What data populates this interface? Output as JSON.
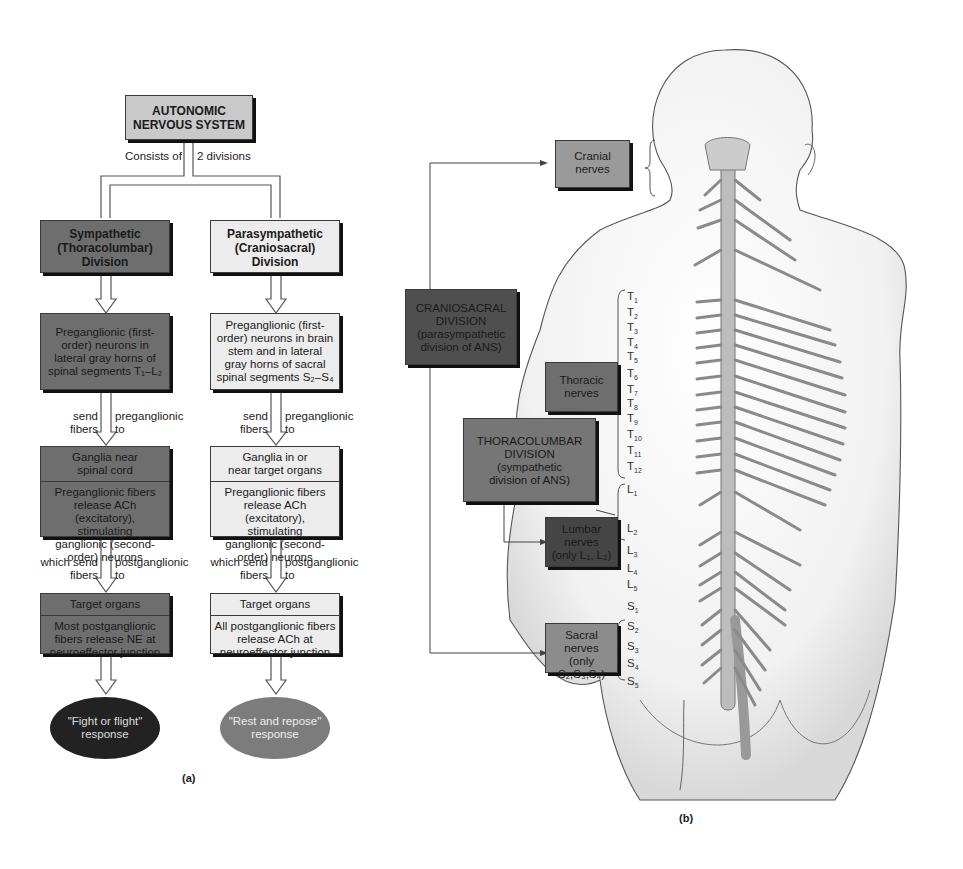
{
  "panel_a": {
    "caption": "(a)",
    "title": [
      "AUTONOMIC",
      "NERVOUS SYSTEM"
    ],
    "split_label_left": "Consists of",
    "split_label_right": "2 divisions",
    "sympathetic": {
      "division": [
        "Sympathetic",
        "(Thoracolumbar)",
        "Division"
      ],
      "preganglionic": [
        "Preganglionic (first-",
        "order) neurons in",
        "lateral gray horns of",
        "spinal segments T₁–L₂"
      ],
      "arrow1_left": [
        "send",
        "fibers"
      ],
      "arrow1_right": [
        "preganglionic",
        "to"
      ],
      "ganglia_title": [
        "Ganglia near",
        "spinal cord"
      ],
      "ganglia_body": [
        "Preganglionic fibers",
        "release ACh (excitatory),",
        "stimulating",
        "ganglionic (second-",
        "order) neurons"
      ],
      "arrow2_left": [
        "which send",
        "fibers"
      ],
      "arrow2_right": [
        "postganglionic",
        "to"
      ],
      "target_title": "Target organs",
      "target_body": [
        "Most postganglionic",
        "fibers release NE at",
        "neuroeffector junction"
      ],
      "response": [
        "\"Fight or flight\"",
        "response"
      ]
    },
    "parasympathetic": {
      "division": [
        "Parasympathetic",
        "(Craniosacral)",
        "Division"
      ],
      "preganglionic": [
        "Preganglionic (first-",
        "order) neurons in brain",
        "stem and in lateral",
        "gray horns of sacral",
        "spinal segments S₂–S₄"
      ],
      "arrow1_left": [
        "send",
        "fibers"
      ],
      "arrow1_right": [
        "preganglionic",
        "to"
      ],
      "ganglia_title": [
        "Ganglia in or",
        "near target organs"
      ],
      "ganglia_body": [
        "Preganglionic fibers",
        "release ACh (excitatory),",
        "stimulating",
        "ganglionic (second-",
        "order) neurons"
      ],
      "arrow2_left": [
        "which send",
        "fibers"
      ],
      "arrow2_right": [
        "postganglionic",
        "to"
      ],
      "target_title": "Target organs",
      "target_body": [
        "All postganglionic fibers",
        "release ACh at",
        "neuroeffector junction"
      ],
      "response": [
        "\"Rest and repose\"",
        "response"
      ]
    }
  },
  "panel_b": {
    "caption": "(b)",
    "cranial_nerves": [
      "Cranial",
      "nerves"
    ],
    "craniosacral": [
      "CRANIOSACRAL",
      "DIVISION",
      "(parasympathetic",
      "division of ANS)"
    ],
    "thoracic_nerves": [
      "Thoracic",
      "nerves"
    ],
    "thoracolumbar": [
      "THORACOLUMBAR",
      "DIVISION",
      "(sympathetic",
      "division of ANS)"
    ],
    "lumbar_nerves": [
      "Lumbar",
      "nerves",
      "(only L₁, L₂)"
    ],
    "sacral_nerves": [
      "Sacral",
      "nerves",
      "(only S₂,S₃,S₄)"
    ],
    "segments": [
      {
        "l": "T",
        "n": "1",
        "y": 298
      },
      {
        "l": "T",
        "n": "2",
        "y": 314
      },
      {
        "l": "T",
        "n": "3",
        "y": 329
      },
      {
        "l": "T",
        "n": "4",
        "y": 344
      },
      {
        "l": "T",
        "n": "5",
        "y": 358
      },
      {
        "l": "T",
        "n": "6",
        "y": 375
      },
      {
        "l": "T",
        "n": "7",
        "y": 391
      },
      {
        "l": "T",
        "n": "8",
        "y": 405
      },
      {
        "l": "T",
        "n": "9",
        "y": 420
      },
      {
        "l": "T",
        "n": "10",
        "y": 436
      },
      {
        "l": "T",
        "n": "11",
        "y": 452
      },
      {
        "l": "T",
        "n": "12",
        "y": 468
      },
      {
        "l": "L",
        "n": "1",
        "y": 491
      },
      {
        "l": "L",
        "n": "2",
        "y": 530
      },
      {
        "l": "L",
        "n": "3",
        "y": 552
      },
      {
        "l": "L",
        "n": "4",
        "y": 570
      },
      {
        "l": "L",
        "n": "5",
        "y": 586
      },
      {
        "l": "S",
        "n": "1",
        "y": 608
      },
      {
        "l": "S",
        "n": "2",
        "y": 628
      },
      {
        "l": "S",
        "n": "3",
        "y": 648
      },
      {
        "l": "S",
        "n": "4",
        "y": 665
      },
      {
        "l": "S",
        "n": "5",
        "y": 683
      }
    ]
  },
  "colors": {
    "sympathetic": "#6e6e6e",
    "parasympathetic": "#ececec",
    "title": "#c9c9c9",
    "fight_oval": "#222222",
    "rest_oval": "#7c7c7c"
  }
}
